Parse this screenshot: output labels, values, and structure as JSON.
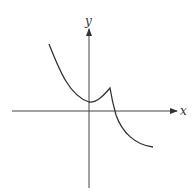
{
  "diagram": {
    "type": "function-graph",
    "axes": {
      "x_label": "x",
      "y_label": "y"
    },
    "curve_description": "Decreasing curve from upper left to a local minimum at the y-axis (above x-axis), rising to a cusp just right of the y-axis, then decreasing sharply across the x-axis and leveling off in the lower right",
    "colors": {
      "line": "#333333",
      "background": "#ffffff"
    }
  }
}
